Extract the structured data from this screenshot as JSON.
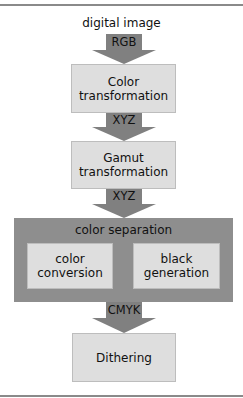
{
  "diagram": {
    "input_label": "digital image",
    "arrows": [
      {
        "label": "RGB"
      },
      {
        "label": "XYZ"
      },
      {
        "label": "XYZ"
      },
      {
        "label": "CMYK"
      }
    ],
    "stages": [
      {
        "label_line1": "Color",
        "label_line2": "transformation"
      },
      {
        "label_line1": "Gamut",
        "label_line2": "transformation"
      }
    ],
    "separation": {
      "title": "color separation",
      "sub_stages": [
        {
          "label_line1": "color",
          "label_line2": "conversion"
        },
        {
          "label_line1": "black",
          "label_line2": "generation"
        }
      ]
    },
    "final_stage": {
      "label": "Dithering"
    },
    "colors": {
      "arrow": "#808080",
      "box_fill": "#dedede",
      "box_border": "#bdbdbd",
      "separation_fill": "#8e8e8e",
      "rule": "#8a8a8a"
    }
  }
}
